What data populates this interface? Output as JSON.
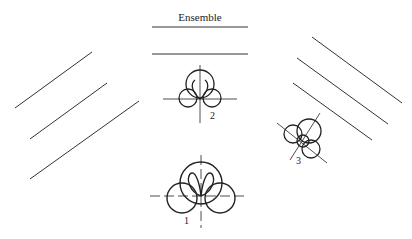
{
  "title": "Ensemble",
  "patterns": [
    {
      "id": "1",
      "label": "1"
    },
    {
      "id": "2",
      "label": "2"
    },
    {
      "id": "3",
      "label": "3"
    }
  ],
  "colors": {
    "stroke": "#222222",
    "line": "#333333",
    "background": "#ffffff"
  }
}
